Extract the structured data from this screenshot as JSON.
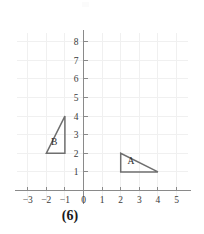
{
  "figure": {
    "caption": "(6)",
    "background_color": "#ffffff",
    "axis_color": "#8a8a8a",
    "grid_color": "#f0f0f0",
    "shape_stroke_color": "#6f6f6f",
    "label_color": "#2b2b2b"
  },
  "chart_data": {
    "type": "scatter",
    "title": "(6)",
    "xlabel": "",
    "ylabel": "",
    "grid": true,
    "legend": "none",
    "xlim": [
      -3.6,
      5.6
    ],
    "ylim": [
      -0.6,
      8.6
    ],
    "x_ticks": [
      -3,
      -2,
      -1,
      0,
      1,
      2,
      3,
      4,
      5
    ],
    "x_tick_labels": [
      "−3",
      "−2",
      "−1",
      "0",
      "1",
      "2",
      "3",
      "4",
      "5"
    ],
    "y_ticks": [
      1,
      2,
      3,
      4,
      5,
      6,
      7,
      8
    ],
    "y_tick_labels": [
      "1",
      "2",
      "3",
      "4",
      "5",
      "6",
      "7",
      "8"
    ],
    "shapes": [
      {
        "name": "triangle-a",
        "label": "A",
        "label_point": [
          2.55,
          1.45
        ],
        "vertices": [
          [
            2,
            1
          ],
          [
            2,
            2
          ],
          [
            4,
            1
          ]
        ],
        "closed": true
      },
      {
        "name": "triangle-b",
        "label": "B",
        "label_point": [
          -1.58,
          2.45
        ],
        "vertices": [
          [
            -2,
            2
          ],
          [
            -1,
            4
          ],
          [
            -1,
            2
          ]
        ],
        "closed": true
      }
    ]
  }
}
